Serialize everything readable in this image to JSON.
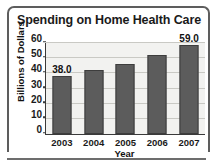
{
  "chart_data": {
    "type": "bar",
    "title": "Spending on Home Health Care",
    "xlabel": "Year",
    "ylabel": "Billions of Dollars",
    "categories": [
      "2003",
      "2004",
      "2005",
      "2006",
      "2007"
    ],
    "values": [
      38.0,
      42.0,
      46.0,
      52.0,
      59.0
    ],
    "data_labels": [
      "38.0",
      "",
      "",
      "",
      "59.0"
    ],
    "ylim": [
      0,
      60
    ],
    "yticks": [
      0,
      10,
      20,
      30,
      40,
      50,
      60
    ],
    "ytick_labels": [
      "0",
      "10",
      "20",
      "30",
      "40",
      "50",
      "60"
    ],
    "grid": true,
    "legend": "none",
    "bar_color": "#5c5c5c",
    "plot_background": "#f2f2f0",
    "axis_color": "#3a3a3a",
    "gridline_color": "#c9c9c4",
    "frame_color": "#5d5d5d",
    "text_color": "#111111"
  }
}
